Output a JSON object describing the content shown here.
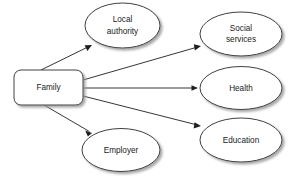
{
  "diagram": {
    "type": "node-edge-diagram",
    "background_color": "#ffffff",
    "stroke_color": "#2a2a2a",
    "shadow_color": "#b4b4b4",
    "nodes": [
      {
        "id": "family",
        "shape": "rounded-rectangle",
        "label": "Family",
        "label_lines": [
          "Family"
        ],
        "cx": 48.5,
        "cy": 87.5,
        "width": 69,
        "height": 35,
        "corner_radius": 7
      },
      {
        "id": "local-authority",
        "shape": "ellipse",
        "label": "Local authority",
        "label_lines": [
          "Local",
          "authority"
        ],
        "cx": 122.5,
        "cy": 25.5,
        "rx": 37.5,
        "ry": 22.5
      },
      {
        "id": "social-services",
        "shape": "ellipse",
        "label": "Social services",
        "label_lines": [
          "Social",
          "services"
        ],
        "cx": 241,
        "cy": 34,
        "rx": 41,
        "ry": 22
      },
      {
        "id": "health",
        "shape": "ellipse",
        "label": "Health",
        "label_lines": [
          "Health"
        ],
        "cx": 241,
        "cy": 88,
        "rx": 41,
        "ry": 21.5
      },
      {
        "id": "education",
        "shape": "ellipse",
        "label": "Education",
        "label_lines": [
          "Education"
        ],
        "cx": 241,
        "cy": 140,
        "rx": 41,
        "ry": 22
      },
      {
        "id": "employer",
        "shape": "ellipse",
        "label": "Employer",
        "label_lines": [
          "Employer"
        ],
        "cx": 121,
        "cy": 150,
        "rx": 39,
        "ry": 21.5
      }
    ],
    "edges": [
      {
        "id": "family-to-local-authority",
        "from": "family",
        "to": "local-authority",
        "label": "",
        "arrow": "end",
        "x1": 41,
        "y1": 70,
        "x2": 92,
        "y2": 45
      },
      {
        "id": "family-to-social-services",
        "from": "family",
        "to": "social-services",
        "label": "",
        "arrow": "end",
        "x1": 83,
        "y1": 80,
        "x2": 201,
        "y2": 46
      },
      {
        "id": "family-to-health",
        "from": "family",
        "to": "health",
        "label": "",
        "arrow": "end",
        "x1": 83,
        "y1": 88,
        "x2": 198,
        "y2": 88
      },
      {
        "id": "family-to-education",
        "from": "family",
        "to": "education",
        "label": "",
        "arrow": "end",
        "x1": 83,
        "y1": 96,
        "x2": 201,
        "y2": 126
      },
      {
        "id": "family-to-employer",
        "from": "family",
        "to": "employer",
        "label": "",
        "arrow": "end",
        "x1": 44,
        "y1": 105,
        "x2": 92,
        "y2": 133
      }
    ]
  }
}
